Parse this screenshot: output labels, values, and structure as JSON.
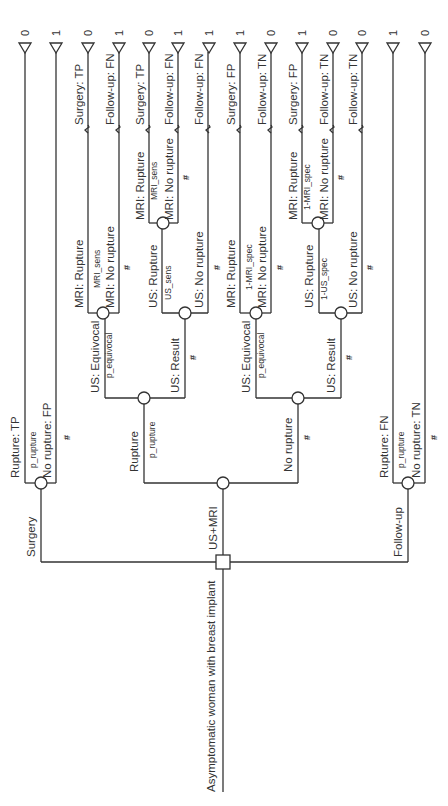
{
  "root": {
    "label": "Asymptomatic woman with breast implant"
  },
  "decision": {
    "options": [
      {
        "label": "Surgery"
      },
      {
        "label": "US+MRI"
      },
      {
        "label": "Follow-up"
      }
    ]
  },
  "surgery": {
    "branches": [
      {
        "label": "Rupture: TP",
        "prob": "p_rupture",
        "payoff": "0"
      },
      {
        "label": "No rupture: FP",
        "prob": "#",
        "payoff": "1"
      }
    ]
  },
  "usmri": {
    "rupture": {
      "label": "Rupture",
      "prob": "p_rupture",
      "equivocal": {
        "label": "US: Equivocal",
        "prob": "p_equivocal",
        "mri_rupture": {
          "label": "MRI: Rupture",
          "prob": "MRI_sens",
          "outcome": "Surgery: TP",
          "payoff": "0"
        },
        "mri_no_rupture": {
          "label": "MRI: No rupture",
          "prob": "#",
          "outcome": "Follow-up: FN",
          "payoff": "1"
        }
      },
      "result": {
        "label": "US: Result",
        "prob": "#",
        "us_rupture": {
          "label": "US: Rupture",
          "prob": "US_sens",
          "mri_rupture": {
            "label": "MRI: Rupture",
            "prob": "MRI_sens",
            "outcome": "Surgery: TP",
            "payoff": "0"
          },
          "mri_no_rupture": {
            "label": "MRI: No rupture",
            "prob": "#",
            "outcome": "Follow-up: FN",
            "payoff": "1"
          }
        },
        "us_no_rupture": {
          "label": "US: No rupture",
          "prob": "#",
          "outcome": "Follow-up: FN",
          "payoff": "1"
        }
      }
    },
    "no_rupture": {
      "label": "No rupture",
      "prob": "#",
      "equivocal": {
        "label": "US: Equivocal",
        "prob": "p_equivocal",
        "mri_rupture": {
          "label": "MRI: Rupture",
          "prob": "1-MRI_spec",
          "outcome": "Surgery: FP",
          "payoff": "1"
        },
        "mri_no_rupture": {
          "label": "MRI: No rupture",
          "prob": "#",
          "outcome": "Follow-up: TN",
          "payoff": "0"
        }
      },
      "result": {
        "label": "US: Result",
        "prob": "#",
        "us_rupture": {
          "label": "US: Rupture",
          "prob": "1-US_spec",
          "mri_rupture": {
            "label": "MRI: Rupture",
            "prob": "1-MRI_spec",
            "outcome": "Surgery: FP",
            "payoff": "1"
          },
          "mri_no_rupture": {
            "label": "MRI: No rupture",
            "prob": "#",
            "outcome": "Follow-up: TN",
            "payoff": "0"
          }
        },
        "us_no_rupture": {
          "label": "US: No rupture",
          "prob": "#",
          "outcome": "Follow-up: TN",
          "payoff": "0"
        }
      }
    }
  },
  "followup": {
    "branches": [
      {
        "label": "Rupture: FN",
        "prob": "p_rupture",
        "payoff": "1"
      },
      {
        "label": "No rupture: TN",
        "prob": "#",
        "payoff": "0"
      }
    ]
  }
}
